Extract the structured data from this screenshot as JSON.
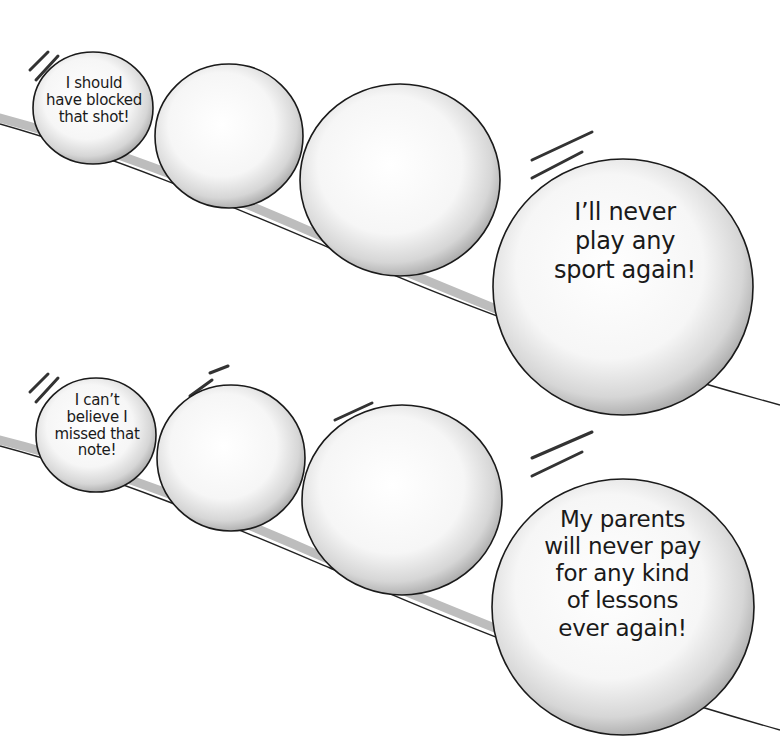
{
  "panels": [
    {
      "name": "sports",
      "balls": [
        {
          "label": "I should have blocked that shot!",
          "lines": [
            "I should",
            "have blocked",
            "that shot!"
          ]
        },
        {
          "label": ""
        },
        {
          "label": ""
        },
        {
          "label": "I'll never play any sport again!",
          "lines": [
            "I’ll never",
            "play any",
            "sport again!"
          ]
        }
      ]
    },
    {
      "name": "music",
      "balls": [
        {
          "label": "I can't believe I missed that note!",
          "lines": [
            "I can’t",
            "believe I",
            "missed that",
            "note!"
          ]
        },
        {
          "label": ""
        },
        {
          "label": ""
        },
        {
          "label": "My parents will never pay for any kind of lessons ever again!",
          "lines": [
            "My parents",
            "will never pay",
            "for any kind",
            "of lessons",
            "ever again!"
          ]
        }
      ]
    }
  ],
  "colors": {
    "background": "#ffffff",
    "ink": "#1a1a1a",
    "shade": "#9a9a9a",
    "ball_fill": "#f4f4f4"
  }
}
